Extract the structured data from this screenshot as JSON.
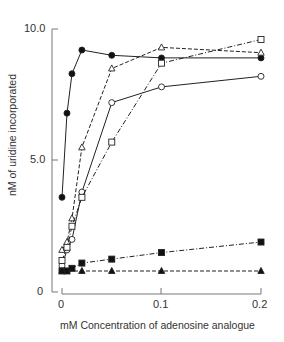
{
  "chart_data": {
    "type": "line",
    "title": "",
    "xlabel": "mM Concentration of adenosine analogue",
    "ylabel": "nM of uridine incorporated",
    "xlim": [
      0,
      0.2
    ],
    "ylim": [
      0,
      10.0
    ],
    "xticks": [
      "0",
      "0.1",
      "0.2"
    ],
    "yticks": [
      "0",
      "5.0",
      "10.0"
    ],
    "grid": false,
    "legend": "none",
    "series": [
      {
        "name": "filled circles",
        "marker": "filled-circle",
        "line": "solid",
        "x": [
          0,
          0.005,
          0.01,
          0.02,
          0.05,
          0.1,
          0.2
        ],
        "y": [
          3.6,
          6.8,
          8.3,
          9.2,
          9.0,
          8.9,
          8.9
        ]
      },
      {
        "name": "open triangles",
        "marker": "open-triangle",
        "line": "dashed",
        "x": [
          0,
          0.005,
          0.01,
          0.02,
          0.05,
          0.1,
          0.2
        ],
        "y": [
          1.6,
          1.9,
          2.8,
          5.5,
          8.5,
          9.3,
          9.1
        ]
      },
      {
        "name": "open circles",
        "marker": "open-circle",
        "line": "solid",
        "x": [
          0,
          0.005,
          0.01,
          0.02,
          0.05,
          0.1,
          0.2
        ],
        "y": [
          1.0,
          1.6,
          2.0,
          3.8,
          7.2,
          7.8,
          8.2
        ]
      },
      {
        "name": "open squares",
        "marker": "open-square",
        "line": "dashdot",
        "x": [
          0,
          0.005,
          0.01,
          0.02,
          0.05,
          0.1,
          0.2
        ],
        "y": [
          1.2,
          1.7,
          2.5,
          3.6,
          5.7,
          8.7,
          9.6
        ]
      },
      {
        "name": "filled squares",
        "marker": "filled-square",
        "line": "dashdot",
        "x": [
          0,
          0.005,
          0.01,
          0.02,
          0.05,
          0.1,
          0.2
        ],
        "y": [
          0.8,
          0.8,
          0.9,
          1.1,
          1.25,
          1.5,
          1.9
        ]
      },
      {
        "name": "filled triangles",
        "marker": "filled-triangle",
        "line": "dashed",
        "x": [
          0,
          0.02,
          0.05,
          0.1,
          0.2
        ],
        "y": [
          0.8,
          0.8,
          0.8,
          0.8,
          0.8
        ]
      }
    ]
  },
  "labels": {
    "ylabel": "nM of uridine incorporated",
    "xlabel": "mM Concentration of adenosine analogue",
    "ytick_0": "0",
    "ytick_5": "5.0",
    "ytick_10": "10.0",
    "xtick_0": "0",
    "xtick_01": "0.1",
    "xtick_02": "0.2"
  }
}
